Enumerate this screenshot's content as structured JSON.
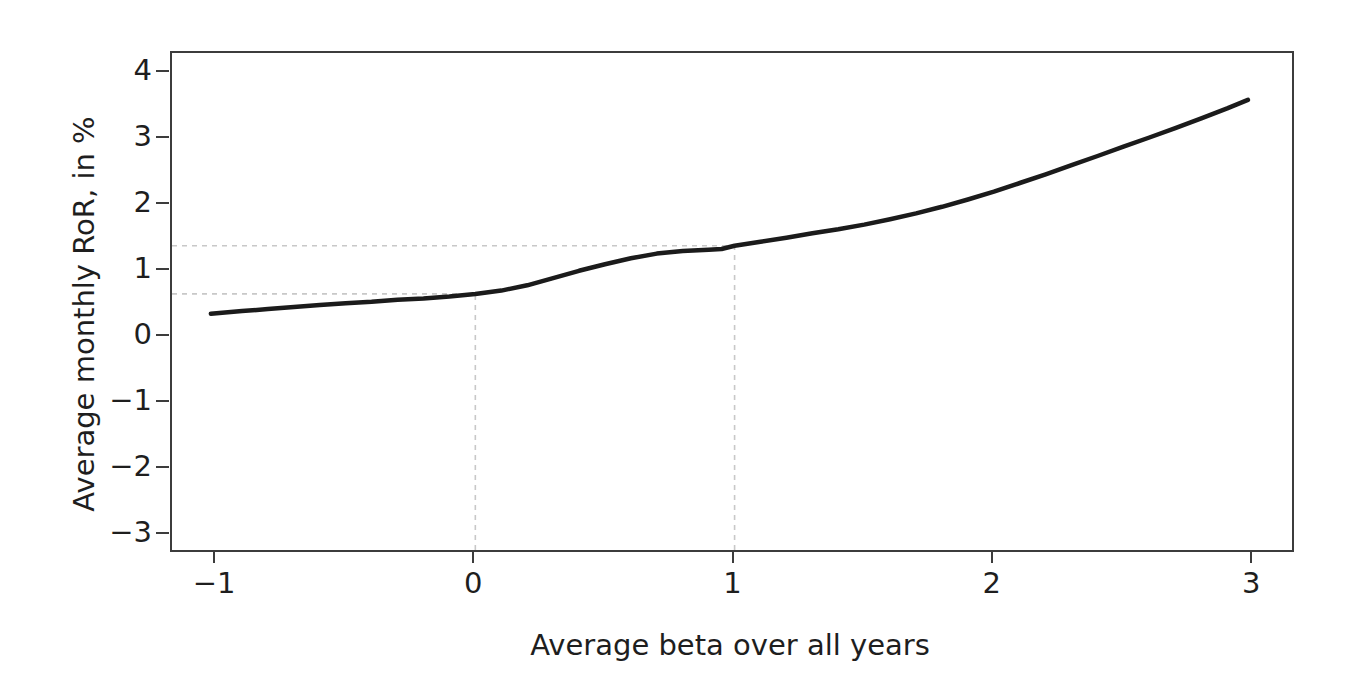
{
  "page": {
    "background": "#ffffff"
  },
  "chart_data": {
    "type": "line",
    "title": "",
    "xlabel": "Average beta over all years",
    "ylabel": "Average monthly RoR, in %",
    "xlim": [
      -1.17,
      3.15
    ],
    "ylim": [
      -3.23,
      4.3
    ],
    "x_ticks": [
      -1,
      0,
      1,
      2,
      3
    ],
    "y_ticks": [
      -3,
      -2,
      -1,
      0,
      1,
      2,
      3,
      4
    ],
    "grid": false,
    "legend": "none",
    "frame": true,
    "colors": {
      "line": "#1b1b1b",
      "axis": "#3c3c3c",
      "text": "#1e1e1e",
      "reference_dashed": "#c8c8c8"
    },
    "series": [
      {
        "name": "smoothed-average-monthly-ror",
        "x": [
          -1.02,
          -0.9,
          -0.8,
          -0.7,
          -0.6,
          -0.5,
          -0.4,
          -0.3,
          -0.2,
          -0.1,
          0.0,
          0.1,
          0.2,
          0.3,
          0.4,
          0.5,
          0.6,
          0.7,
          0.8,
          0.9,
          0.95,
          1.0,
          1.1,
          1.2,
          1.3,
          1.4,
          1.5,
          1.6,
          1.7,
          1.8,
          1.9,
          2.0,
          2.1,
          2.2,
          2.3,
          2.4,
          2.5,
          2.6,
          2.7,
          2.8,
          2.9,
          2.98
        ],
        "y": [
          0.35,
          0.39,
          0.42,
          0.45,
          0.48,
          0.51,
          0.53,
          0.56,
          0.58,
          0.61,
          0.65,
          0.7,
          0.78,
          0.89,
          1.0,
          1.1,
          1.19,
          1.26,
          1.3,
          1.32,
          1.33,
          1.38,
          1.44,
          1.5,
          1.57,
          1.63,
          1.7,
          1.78,
          1.87,
          1.97,
          2.08,
          2.2,
          2.33,
          2.46,
          2.6,
          2.74,
          2.88,
          3.02,
          3.16,
          3.31,
          3.46,
          3.59
        ]
      }
    ],
    "reference_points": [
      {
        "x": 0,
        "y": 0.65
      },
      {
        "x": 1,
        "y": 1.38
      }
    ]
  }
}
